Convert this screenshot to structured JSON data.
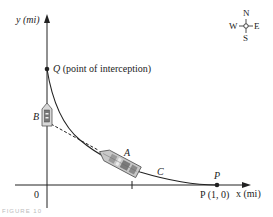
{
  "axes": {
    "y_label": "y (mi)",
    "x_label": "x (mi)",
    "origin_label": "0"
  },
  "points": {
    "Q": {
      "letter": "Q",
      "description": "(point of interception)"
    },
    "P": {
      "letter": "P",
      "coords_label": "P (1, 0)"
    }
  },
  "ships": {
    "A": {
      "label": "A"
    },
    "B": {
      "label": "B"
    }
  },
  "curve": {
    "label": "C"
  },
  "compass": {
    "north": "N",
    "south": "S",
    "east": "E",
    "west": "W"
  },
  "caption": "FIGURE 10",
  "colors": {
    "ink": "#222222",
    "ship_fill": "#c8c8c8",
    "ship_dark": "#6a6a6a",
    "background": "#ffffff"
  }
}
